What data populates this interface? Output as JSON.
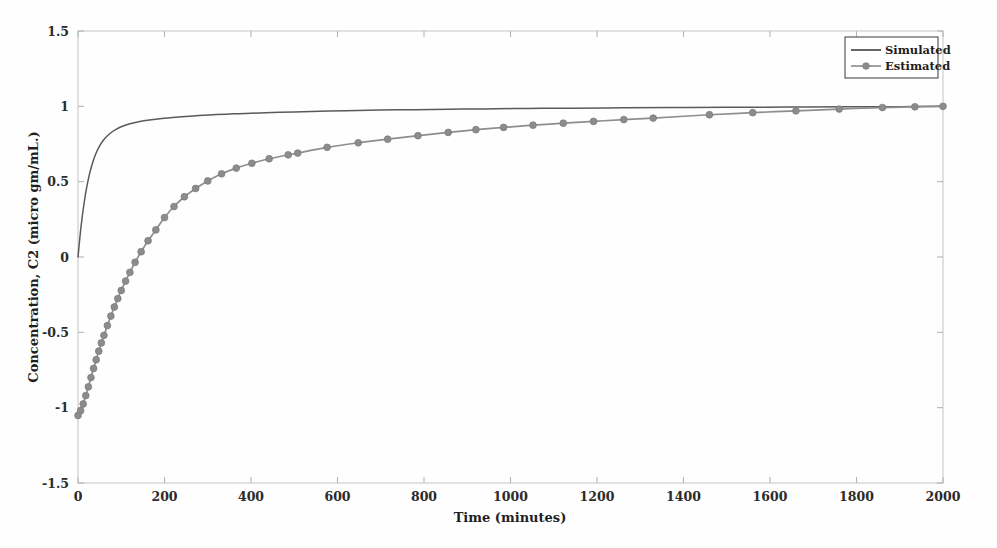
{
  "chart_data": {
    "type": "line",
    "title": "",
    "subtitle": "",
    "xlabel": "Time (minutes)",
    "ylabel": "Concentration, C2 (micro gm/mL.)",
    "xlim": [
      0,
      2000
    ],
    "ylim": [
      -1.5,
      1.5
    ],
    "xticks": [
      0,
      200,
      400,
      600,
      800,
      1000,
      1200,
      1400,
      1600,
      1800,
      2000
    ],
    "xtick_labels": [
      "0",
      "200",
      "400",
      "600",
      "800",
      "1000",
      "1200",
      "1400",
      "1600",
      "1800",
      "2000"
    ],
    "yticks": [
      -1.5,
      -1,
      -0.5,
      0,
      0.5,
      1,
      1.5
    ],
    "ytick_labels": [
      "-1.5",
      "-1",
      "-0.5",
      "0",
      "0.5",
      "1",
      "1.5"
    ],
    "grid": false,
    "legend_position": "top-right",
    "colors": {
      "simulated": "#5a5a5a",
      "estimated": "#8c8c8c",
      "axis": "#c9c9c9",
      "text": "#1f1f1f"
    },
    "series": [
      {
        "name": "Simulated",
        "style": "solid-line",
        "marker": "none",
        "x": [
          0,
          5,
          10,
          15,
          20,
          25,
          30,
          40,
          50,
          60,
          70,
          80,
          90,
          100,
          120,
          140,
          160,
          180,
          200,
          240,
          280,
          320,
          360,
          400,
          450,
          500,
          560,
          620,
          700,
          780,
          860,
          940,
          1040,
          1140,
          1260,
          1380,
          1500,
          1640,
          1780,
          1900,
          2000
        ],
        "y": [
          0.0,
          0.148,
          0.272,
          0.375,
          0.46,
          0.53,
          0.589,
          0.677,
          0.738,
          0.78,
          0.81,
          0.833,
          0.85,
          0.864,
          0.884,
          0.897,
          0.907,
          0.915,
          0.921,
          0.931,
          0.939,
          0.945,
          0.95,
          0.954,
          0.959,
          0.963,
          0.967,
          0.971,
          0.975,
          0.978,
          0.981,
          0.983,
          0.986,
          0.988,
          0.99,
          0.992,
          0.994,
          0.995,
          0.997,
          0.998,
          1.0
        ]
      },
      {
        "name": "Estimated",
        "style": "line-with-markers",
        "marker": "circle",
        "x": [
          0,
          6,
          12,
          18,
          24,
          30,
          36,
          42,
          48,
          54,
          60,
          68,
          76,
          84,
          92,
          100,
          110,
          120,
          132,
          146,
          162,
          180,
          200,
          222,
          246,
          272,
          300,
          332,
          366,
          402,
          442,
          486,
          508,
          576,
          648,
          716,
          786,
          856,
          920,
          984,
          1052,
          1122,
          1192,
          1262,
          1330,
          1460,
          1560,
          1660,
          1760,
          1860,
          1935,
          2000
        ],
        "y": [
          -1.052,
          -1.02,
          -0.975,
          -0.92,
          -0.862,
          -0.8,
          -0.74,
          -0.682,
          -0.625,
          -0.57,
          -0.52,
          -0.455,
          -0.392,
          -0.332,
          -0.276,
          -0.222,
          -0.16,
          -0.102,
          -0.035,
          0.035,
          0.108,
          0.18,
          0.262,
          0.335,
          0.4,
          0.455,
          0.505,
          0.552,
          0.59,
          0.622,
          0.652,
          0.678,
          0.69,
          0.728,
          0.758,
          0.782,
          0.805,
          0.827,
          0.845,
          0.86,
          0.875,
          0.888,
          0.9,
          0.912,
          0.922,
          0.944,
          0.958,
          0.97,
          0.982,
          0.992,
          0.997,
          1.0
        ]
      }
    ]
  },
  "legend": {
    "items": [
      {
        "label": "Simulated"
      },
      {
        "label": "Estimated"
      }
    ]
  },
  "plot_geometry": {
    "left": 78,
    "right": 943,
    "top": 31,
    "bottom": 483
  }
}
